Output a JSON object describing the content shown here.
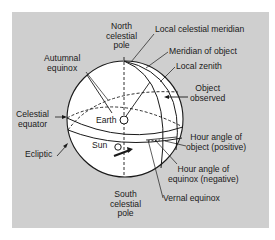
{
  "colors": {
    "panel_bg": "#cfcfcf",
    "sphere_fill": "#ffffff",
    "line": "#1a1a1a"
  },
  "labels": {
    "north_pole": [
      "North",
      "celestial",
      "pole"
    ],
    "local_celestial_meridian": "Local celestial meridian",
    "meridian_of_object": "Meridian of object",
    "local_zenith": "Local zenith",
    "autumnal_equinox": [
      "Autumnal",
      "equinox"
    ],
    "object_observed": [
      "Object",
      "observed"
    ],
    "celestial_equator": [
      "Celestial",
      "equator"
    ],
    "earth": "Earth",
    "sun": "Sun",
    "ecliptic": "Ecliptic",
    "hour_angle_object": [
      "Hour angle of",
      "object (positive)"
    ],
    "hour_angle_equinox": [
      "Hour angle of",
      "equinox (negative)"
    ],
    "south_pole": [
      "South",
      "celestial",
      "pole"
    ],
    "vernal_equinox": "Vernal equinox"
  }
}
